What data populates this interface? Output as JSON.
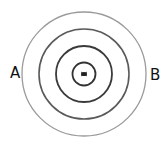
{
  "diagram": {
    "type": "concentric-circles",
    "center": {
      "x": 84,
      "y": 74
    },
    "circles": [
      {
        "name": "outer-ring",
        "r": 62,
        "stroke": "#9a9a9a",
        "width": 1.3
      },
      {
        "name": "second-ring",
        "r": 45,
        "stroke": "#5a5a5a",
        "width": 1.6
      },
      {
        "name": "third-ring",
        "r": 28,
        "stroke": "#3a3a3a",
        "width": 1.8
      },
      {
        "name": "inner-ring",
        "r": 11.5,
        "stroke": "#333333",
        "width": 1.8
      }
    ],
    "center_mark": "source point"
  },
  "labels": {
    "left": "A",
    "right": "B"
  }
}
